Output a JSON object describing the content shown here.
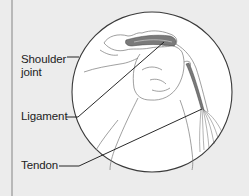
{
  "figure": {
    "labels": {
      "shoulder_line1": "Shoulder",
      "shoulder_line2": "joint",
      "ligament": "Ligament",
      "tendon": "Tendon"
    },
    "colors": {
      "background": "#ececec",
      "circle_fill": "#ffffff",
      "outline": "#333333",
      "tissue": "#7a7a7a",
      "leader": "#111111"
    }
  }
}
